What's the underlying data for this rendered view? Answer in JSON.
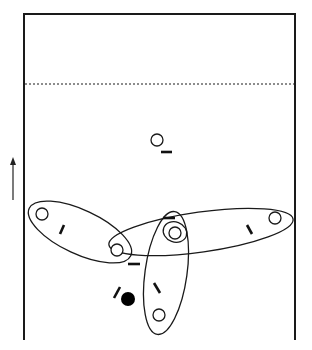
{
  "diagram": {
    "title": "Volleyball rotation / formation diagram",
    "colors": {
      "stroke": "#1a1a1a",
      "background": "#ffffff",
      "ball": "#000000"
    },
    "court": {
      "left": 24,
      "top": 14,
      "right": 295,
      "bottom": 340,
      "attack_line_y": 84
    },
    "direction_arrow": {
      "x": 13,
      "y_start": 200,
      "y_end": 157,
      "label": "direction"
    },
    "players": [
      {
        "id": "p-top",
        "cx": 157,
        "cy": 140,
        "r": 6,
        "marker": {
          "x1": 161,
          "y1": 152,
          "x2": 172,
          "y2": 152
        }
      },
      {
        "id": "p-left",
        "cx": 42,
        "cy": 214,
        "r": 6,
        "marker": {
          "x1": 64,
          "y1": 225,
          "x2": 60,
          "y2": 234
        }
      },
      {
        "id": "p-mid-left",
        "cx": 117,
        "cy": 250,
        "r": 6,
        "marker": {
          "x1": 128,
          "y1": 264,
          "x2": 140,
          "y2": 264
        }
      },
      {
        "id": "p-center",
        "cx": 175,
        "cy": 233,
        "r": 6,
        "marker": {
          "x1": 163,
          "y1": 218,
          "x2": 175,
          "y2": 218
        }
      },
      {
        "id": "p-right",
        "cx": 275,
        "cy": 218,
        "r": 6,
        "marker": {
          "x1": 247,
          "y1": 225,
          "x2": 252,
          "y2": 234
        }
      },
      {
        "id": "p-bottom",
        "cx": 159,
        "cy": 315,
        "r": 6,
        "marker": {
          "x1": 154,
          "y1": 283,
          "x2": 160,
          "y2": 293
        }
      }
    ],
    "groupings": [
      {
        "id": "group-left-midleft",
        "cx": 80,
        "cy": 232,
        "rx": 56,
        "ry": 22,
        "rotate": 25
      },
      {
        "id": "group-midleft-right",
        "cx": 201,
        "cy": 232,
        "rx": 93,
        "ry": 20,
        "rotate": -8
      },
      {
        "id": "group-center-bottom",
        "cx": 166,
        "cy": 273,
        "rx": 62,
        "ry": 21,
        "rotate": 98
      },
      {
        "id": "group-center-ring",
        "cx": 175,
        "cy": 232,
        "rx": 12,
        "ry": 10,
        "rotate": 20
      }
    ],
    "ball": {
      "cx": 128,
      "cy": 299,
      "r": 7,
      "marker": {
        "x1": 114,
        "y1": 298,
        "x2": 120,
        "y2": 287
      }
    }
  }
}
